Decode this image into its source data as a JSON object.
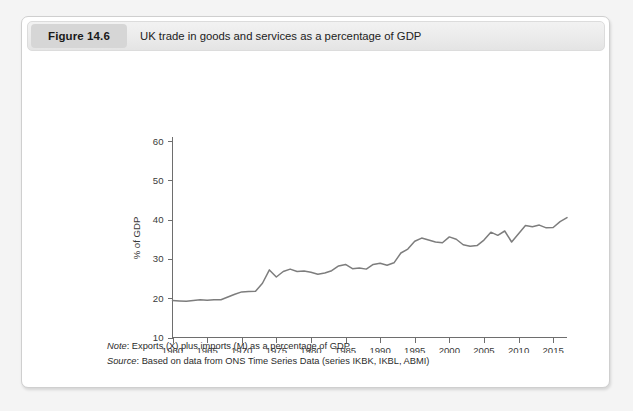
{
  "figure": {
    "badge_label": "Figure 14.6",
    "title": "UK trade in goods and services as a percentage of GDP"
  },
  "notes": {
    "note_label": "Note",
    "note_text": ": Exports (X) plus imports (M) as a percentage of GDP",
    "source_label": "Source",
    "source_text": ": Based on data from ONS Time Series Data (series IKBK, IKBL, ABMI)"
  },
  "colors": {
    "line": "#7d7d7d",
    "axis": "#6e6e6e",
    "badge_bg": "#d6d6d6",
    "header_bg": "#ebebeb",
    "card_bg": "#ffffff",
    "page_bg": "#f4f4f4"
  },
  "chart_data": {
    "type": "line",
    "title": "UK trade in goods and services as a percentage of GDP",
    "xlabel": "",
    "ylabel": "% of GDP",
    "xlim": [
      1960,
      2017
    ],
    "ylim": [
      10,
      60
    ],
    "yticks": [
      10,
      20,
      30,
      40,
      50,
      60
    ],
    "xticks": [
      1960,
      1965,
      1970,
      1975,
      1980,
      1985,
      1990,
      1995,
      2000,
      2005,
      2010,
      2015
    ],
    "grid": false,
    "legend": "none",
    "series": [
      {
        "name": "UK trade in goods and services (% of GDP)",
        "x": [
          1960,
          1961,
          1962,
          1963,
          1964,
          1965,
          1966,
          1967,
          1968,
          1969,
          1970,
          1971,
          1972,
          1973,
          1974,
          1975,
          1976,
          1977,
          1978,
          1979,
          1980,
          1981,
          1982,
          1983,
          1984,
          1985,
          1986,
          1987,
          1988,
          1989,
          1990,
          1991,
          1992,
          1993,
          1994,
          1995,
          1996,
          1997,
          1998,
          1999,
          2000,
          2001,
          2002,
          2003,
          2004,
          2005,
          2006,
          2007,
          2008,
          2009,
          2010,
          2011,
          2012,
          2013,
          2014,
          2015,
          2016,
          2017
        ],
        "values": [
          19.4,
          19.3,
          19.2,
          19.4,
          19.6,
          19.5,
          19.6,
          19.6,
          20.3,
          21.0,
          21.6,
          21.7,
          21.8,
          23.8,
          27.2,
          25.4,
          26.8,
          27.4,
          26.8,
          26.9,
          26.6,
          26.1,
          26.4,
          27.0,
          28.2,
          28.6,
          27.5,
          27.7,
          27.4,
          28.6,
          28.9,
          28.4,
          29.0,
          31.5,
          32.5,
          34.5,
          35.3,
          34.8,
          34.3,
          34.1,
          35.6,
          35.0,
          33.6,
          33.2,
          33.4,
          34.8,
          36.8,
          36.0,
          37.1,
          34.3,
          36.4,
          38.5,
          38.2,
          38.6,
          37.9,
          38.0,
          39.5,
          40.5
        ]
      }
    ]
  }
}
